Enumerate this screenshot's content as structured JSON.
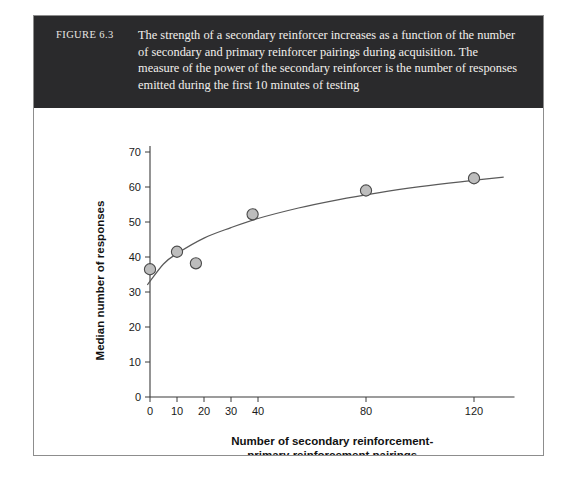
{
  "figure": {
    "number_label": "FIGURE 6.3",
    "caption": "The strength of a secondary reinforcer increases as a function of the number of secondary and primary reinforcer pairings during acquisition. The measure of the power of the secondary reinforcer is the number of responses emitted during the first 10 minutes of testing",
    "banner_color": "#2a2a2c",
    "banner_text_color": "#f2f0ed",
    "frame_border_color": "#8d8d8d",
    "background_color": "#ffffff"
  },
  "chart_data": {
    "type": "scatter",
    "title": "",
    "xlabel_line1": "Number of secondary reinforcement-",
    "xlabel_line2": "primary reinforcement pairings",
    "ylabel": "Median number of responses",
    "x": [
      0,
      10,
      17,
      38,
      80,
      120
    ],
    "values": [
      36.5,
      41.5,
      38.2,
      52.2,
      59.0,
      62.5
    ],
    "xticks": [
      0,
      10,
      20,
      30,
      40,
      80,
      120
    ],
    "xtick_labels": [
      "0",
      "10",
      "20",
      "30",
      "40",
      "80",
      "120"
    ],
    "yticks": [
      0,
      10,
      20,
      30,
      40,
      50,
      60,
      70
    ],
    "ytick_labels": [
      "0",
      "10",
      "20",
      "30",
      "40",
      "50",
      "60",
      "70"
    ],
    "xlim": [
      0,
      135
    ],
    "ylim": [
      0,
      70
    ],
    "grid": false,
    "legend": null,
    "marker_fill_color": "#bdbdbd",
    "marker_edge_color": "#4a4a4a",
    "curve_color": "#5a5a5a",
    "curve_description": "Negatively accelerated increasing fitted curve rising from about 32 responses near 0 pairings to about 63 responses at 130 pairings",
    "curve_points": [
      [
        -1,
        32.0
      ],
      [
        5,
        38.0
      ],
      [
        10,
        41.0
      ],
      [
        20,
        45.4
      ],
      [
        30,
        48.4
      ],
      [
        40,
        51.0
      ],
      [
        55,
        54.0
      ],
      [
        70,
        56.4
      ],
      [
        85,
        58.4
      ],
      [
        100,
        60.1
      ],
      [
        115,
        61.5
      ],
      [
        131,
        62.8
      ]
    ]
  }
}
